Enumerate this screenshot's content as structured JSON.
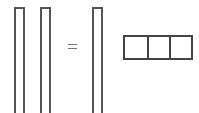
{
  "diagram": {
    "left_columns": [
      {
        "id": "col-1"
      },
      {
        "id": "col-2"
      }
    ],
    "operator": "=",
    "right_column": {
      "id": "col-3"
    },
    "row_vector": {
      "cells": 3
    },
    "colors": {
      "stroke": "#555555",
      "background": "#ffffff"
    }
  }
}
